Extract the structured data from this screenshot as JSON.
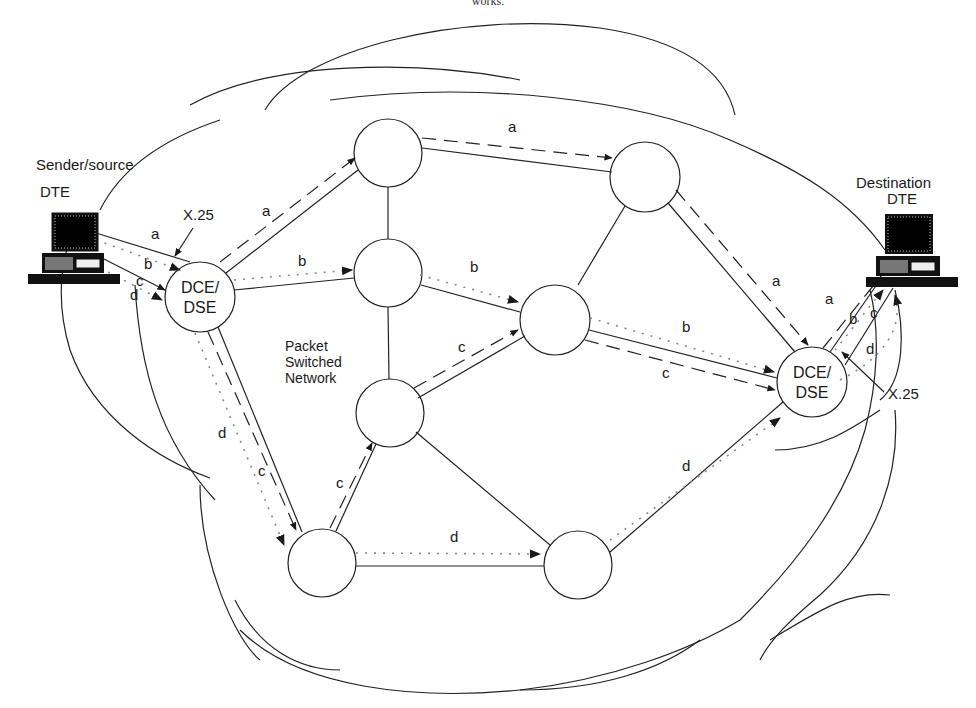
{
  "caption": "works.",
  "network_label": {
    "line1": "Packet",
    "line2": "Switched",
    "line3": "Network"
  },
  "sender": {
    "line1": "Sender/source",
    "line2": "DTE"
  },
  "destination": {
    "line1": "Destination",
    "line2": "DTE"
  },
  "interface_labels": {
    "left": "X.25",
    "right": "X.25"
  },
  "dce_left": {
    "line1": "DCE/",
    "line2": "DSE"
  },
  "dce_right": {
    "line1": "DCE/",
    "line2": "DSE"
  },
  "packet_labels": {
    "a_sender": "a",
    "b_sender": "b",
    "c_sender": "c",
    "d_sender": "d",
    "a_dce_n1": "a",
    "b_dce_n2": "b",
    "a_n1_n4": "a",
    "b_n2_n5": "b",
    "c_n3_n5": "c",
    "d_dce_n6": "d",
    "c_dce_n6": "c",
    "c_n6_n3": "c",
    "d_n6_n7": "d",
    "a_n4_dce": "a",
    "b_n5_dce": "b",
    "c_n5_dce": "c",
    "d_n7_dce": "d",
    "a_dest": "a",
    "b_dest": "b",
    "c_dest": "c",
    "d_dest": "d"
  },
  "line_styles": {
    "a": "dashed",
    "b": "dotted",
    "c": "dashed",
    "d": "dotted"
  },
  "colors": {
    "ink": "#1a1a1a",
    "background": "#ffffff",
    "dotted": "#9a9a9a"
  }
}
